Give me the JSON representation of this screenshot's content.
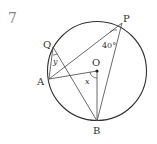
{
  "problem_number": "7",
  "points": {
    "P": {
      "label": "P",
      "x": 122,
      "y": 23
    },
    "Q": {
      "label": "Q",
      "x": 53,
      "y": 47
    },
    "A": {
      "label": "A",
      "x": 49,
      "y": 79
    },
    "O": {
      "label": "O",
      "x": 97,
      "y": 71
    },
    "B": {
      "label": "B",
      "x": 97,
      "y": 121
    }
  },
  "circle": {
    "cx": 97,
    "cy": 71,
    "r": 49.5
  },
  "angles": {
    "P": "40°",
    "Q": "y",
    "O": "x"
  },
  "colors": {
    "stroke": "#333333",
    "number": "#888888"
  }
}
